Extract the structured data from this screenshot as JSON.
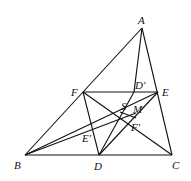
{
  "diagram": {
    "points": {
      "A": {
        "label": "A",
        "x": 142,
        "y": 28,
        "lx": 138,
        "ly": 24
      },
      "B": {
        "label": "B",
        "x": 25,
        "y": 155,
        "lx": 14,
        "ly": 169
      },
      "C": {
        "label": "C",
        "x": 172,
        "y": 155,
        "lx": 172,
        "ly": 169
      },
      "D": {
        "label": "D",
        "x": 99,
        "y": 155,
        "lx": 94,
        "ly": 170
      },
      "E": {
        "label": "E",
        "x": 158,
        "y": 92,
        "lx": 162,
        "ly": 96
      },
      "F": {
        "label": "F",
        "x": 83,
        "y": 92,
        "lx": 71,
        "ly": 96
      },
      "D'": {
        "label": "D'",
        "x": 134,
        "y": 92,
        "lx": 135,
        "ly": 89
      },
      "S": {
        "label": "S",
        "x": 125,
        "y": 112,
        "lx": 121,
        "ly": 110
      },
      "M": {
        "label": "M",
        "x": 135,
        "y": 113,
        "lx": 133,
        "ly": 113
      },
      "F'": {
        "label": "F'",
        "x": 136,
        "y": 120,
        "lx": 131,
        "ly": 131
      },
      "E'": {
        "label": "E'",
        "x": 100,
        "y": 128,
        "lx": 82,
        "ly": 142
      }
    },
    "segments": [
      [
        "A",
        "B"
      ],
      [
        "B",
        "C"
      ],
      [
        "C",
        "A"
      ],
      [
        "A",
        "D"
      ],
      [
        "F",
        "E"
      ],
      [
        "F",
        "D"
      ],
      [
        "D",
        "E"
      ],
      [
        "F",
        "C"
      ],
      [
        "B",
        "E"
      ],
      [
        "D",
        "F'"
      ],
      [
        "E'",
        "M"
      ],
      [
        "D'",
        "S"
      ]
    ]
  }
}
